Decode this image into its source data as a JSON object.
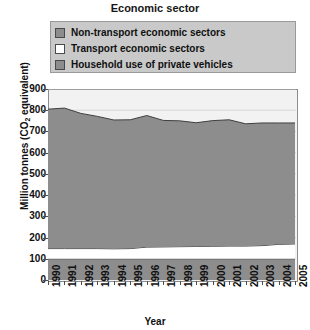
{
  "chart_data": {
    "type": "area",
    "title": "Economic sector",
    "xlabel": "Year",
    "ylabel": "Million tonnes (CO2 equivalent)",
    "ylabel_prefix": "Million tonnes (CO",
    "ylabel_sub": "2",
    "ylabel_suffix": " equivalent)",
    "stacked": true,
    "grid": true,
    "legend_position": "top",
    "ylim": [
      0,
      900
    ],
    "yticks": [
      0,
      100,
      200,
      300,
      400,
      500,
      600,
      700,
      800,
      900
    ],
    "ytick_labels": [
      "0",
      "100",
      "200",
      "300",
      "400",
      "500",
      "600",
      "700",
      "800",
      "900"
    ],
    "categories": [
      "1990",
      "1991",
      "1992",
      "1993",
      "1994",
      "1995",
      "1996",
      "1997",
      "1998",
      "1999",
      "2000",
      "2001",
      "2002",
      "2003",
      "2004",
      "2005"
    ],
    "x": [
      1990,
      1991,
      1992,
      1993,
      1994,
      1995,
      1996,
      1997,
      1998,
      1999,
      2000,
      2001,
      2002,
      2003,
      2004,
      2005
    ],
    "series": [
      {
        "name": "Household use of private vehicles",
        "color": "#8d8d8d",
        "border": "#3f3f3f",
        "values": [
          100,
          100,
          100,
          100,
          100,
          100,
          100,
          100,
          100,
          100,
          100,
          100,
          100,
          100,
          100,
          100
        ]
      },
      {
        "name": "Transport economic sectors",
        "color": "#ffffff",
        "border": "#3f3f3f",
        "values": [
          48,
          48,
          48,
          48,
          47,
          48,
          55,
          56,
          57,
          58,
          59,
          60,
          60,
          62,
          68,
          70
        ]
      },
      {
        "name": "Non-transport economic sectors",
        "color": "#8d8d8d",
        "border": "#3f3f3f",
        "values": [
          657,
          662,
          637,
          623,
          607,
          607,
          620,
          596,
          593,
          583,
          592,
          595,
          576,
          578,
          572,
          570
        ]
      }
    ],
    "stack_totals": [
      805,
      810,
      785,
      771,
      754,
      755,
      775,
      752,
      750,
      741,
      751,
      755,
      736,
      740,
      740,
      740
    ]
  },
  "legend": {
    "items": [
      {
        "label": "Non-transport economic sectors",
        "swatch": "#8d8d8d"
      },
      {
        "label": "Transport economic sectors",
        "swatch": "#ffffff"
      },
      {
        "label": "Household use of private vehicles",
        "swatch": "#8d8d8d"
      }
    ]
  }
}
